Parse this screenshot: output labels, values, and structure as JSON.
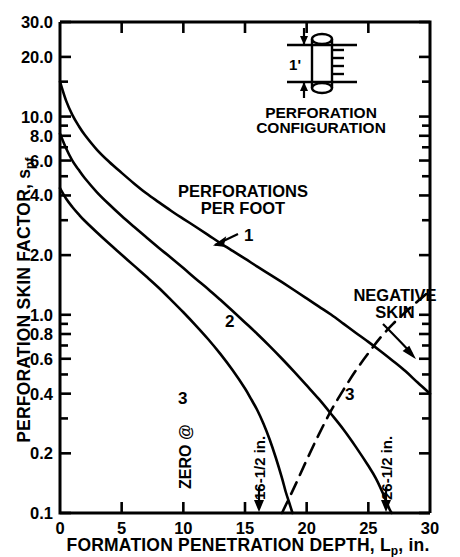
{
  "figure": {
    "background": "#ffffff",
    "ink": "#000000"
  },
  "axes": {
    "y_label": "PERFORATION SKIN FACTOR, s",
    "y_label_sub": "pf",
    "x_label_a": "FORMATION PENETRATION DEPTH, L",
    "x_label_sub": "p",
    "x_label_b": ", in."
  },
  "y_ticks": [
    {
      "label": "30.0",
      "value": 30.0
    },
    {
      "label": "20.0",
      "value": 20.0
    },
    {
      "label": "10.0",
      "value": 10.0
    },
    {
      "label": "8.0",
      "value": 8.0
    },
    {
      "label": "6.0",
      "value": 6.0
    },
    {
      "label": "4.0",
      "value": 4.0
    },
    {
      "label": "2.0",
      "value": 2.0
    },
    {
      "label": "1.0",
      "value": 1.0
    },
    {
      "label": "0.8",
      "value": 0.8
    },
    {
      "label": "0.6",
      "value": 0.6
    },
    {
      "label": "0.4",
      "value": 0.4
    },
    {
      "label": "0.2",
      "value": 0.2
    },
    {
      "label": "0.1",
      "value": 0.1
    }
  ],
  "x_ticks": [
    {
      "label": "0",
      "value": 0
    },
    {
      "label": "5",
      "value": 5
    },
    {
      "label": "10",
      "value": 10
    },
    {
      "label": "15",
      "value": 15
    },
    {
      "label": "20",
      "value": 20
    },
    {
      "label": "25",
      "value": 25
    },
    {
      "label": "30",
      "value": 30
    }
  ],
  "annotations": {
    "perf_per_foot_line1": "PERFORATIONS",
    "perf_per_foot_line2": "PER FOOT",
    "curve_label_1": "1",
    "curve_label_2": "2",
    "curve_label_3": "3",
    "curve_label_3_dashed": "3",
    "negative_skin_line1": "NEGATIVE",
    "negative_skin_line2": "SKIN",
    "zero_at": "ZERO @",
    "callout_16": "16-1/2 in.",
    "callout_26": "26-1/2 in."
  },
  "inset": {
    "title_line1": "PERFORATION",
    "title_line2": "CONFIGURATION",
    "spacing_label": "1'"
  },
  "chart_data": {
    "type": "line",
    "title": "",
    "xlabel": "FORMATION PENETRATION DEPTH, Lp, in.",
    "ylabel": "PERFORATION SKIN FACTOR, spf",
    "xlim": [
      0,
      30
    ],
    "ylim": [
      0.1,
      30.0
    ],
    "yscale": "log",
    "xscale": "linear",
    "grid": false,
    "legend": "none",
    "series": [
      {
        "name": "1",
        "style": "solid",
        "label": "1 perforation per foot",
        "points": [
          [
            0.0,
            15.0
          ],
          [
            0.5,
            12.0
          ],
          [
            1.0,
            10.2
          ],
          [
            1.5,
            9.0
          ],
          [
            2.0,
            8.1
          ],
          [
            3.0,
            6.8
          ],
          [
            4.0,
            5.9
          ],
          [
            5.0,
            5.2
          ],
          [
            6.0,
            4.6
          ],
          [
            7.0,
            4.1
          ],
          [
            8.0,
            3.7
          ],
          [
            9.0,
            3.35
          ],
          [
            10.0,
            3.05
          ],
          [
            11.0,
            2.78
          ],
          [
            12.0,
            2.53
          ],
          [
            13.0,
            2.3
          ],
          [
            14.0,
            2.1
          ],
          [
            15.0,
            1.92
          ],
          [
            16.0,
            1.75
          ],
          [
            17.0,
            1.6
          ],
          [
            18.0,
            1.46
          ],
          [
            19.0,
            1.33
          ],
          [
            20.0,
            1.21
          ],
          [
            21.0,
            1.1
          ],
          [
            22.0,
            1.0
          ],
          [
            23.0,
            0.9
          ],
          [
            24.0,
            0.81
          ],
          [
            25.0,
            0.73
          ],
          [
            26.0,
            0.655
          ],
          [
            27.0,
            0.585
          ],
          [
            28.0,
            0.52
          ],
          [
            29.0,
            0.455
          ],
          [
            30.0,
            0.4
          ]
        ]
      },
      {
        "name": "2",
        "style": "solid",
        "label": "2 perforations per foot",
        "points": [
          [
            0.0,
            8.2
          ],
          [
            0.5,
            6.9
          ],
          [
            1.0,
            6.0
          ],
          [
            1.5,
            5.4
          ],
          [
            2.0,
            4.9
          ],
          [
            3.0,
            4.15
          ],
          [
            4.0,
            3.6
          ],
          [
            5.0,
            3.15
          ],
          [
            6.0,
            2.78
          ],
          [
            7.0,
            2.46
          ],
          [
            8.0,
            2.18
          ],
          [
            9.0,
            1.94
          ],
          [
            10.0,
            1.72
          ],
          [
            11.0,
            1.52
          ],
          [
            12.0,
            1.35
          ],
          [
            13.0,
            1.19
          ],
          [
            14.0,
            1.045
          ],
          [
            15.0,
            0.915
          ],
          [
            16.0,
            0.8
          ],
          [
            17.0,
            0.695
          ],
          [
            18.0,
            0.6
          ],
          [
            19.0,
            0.515
          ],
          [
            20.0,
            0.44
          ],
          [
            21.0,
            0.375
          ],
          [
            22.0,
            0.315
          ],
          [
            23.0,
            0.263
          ],
          [
            24.0,
            0.215
          ],
          [
            25.0,
            0.173
          ],
          [
            25.6,
            0.15
          ],
          [
            26.2,
            0.125
          ],
          [
            26.7,
            0.105
          ],
          [
            26.9,
            0.1
          ]
        ]
      },
      {
        "name": "3",
        "style": "solid",
        "label": "3 perforations per foot",
        "points": [
          [
            0.0,
            4.35
          ],
          [
            0.5,
            3.85
          ],
          [
            1.0,
            3.5
          ],
          [
            1.5,
            3.22
          ],
          [
            2.0,
            2.98
          ],
          [
            3.0,
            2.6
          ],
          [
            4.0,
            2.28
          ],
          [
            5.0,
            2.01
          ],
          [
            6.0,
            1.77
          ],
          [
            7.0,
            1.56
          ],
          [
            8.0,
            1.37
          ],
          [
            9.0,
            1.19
          ],
          [
            10.0,
            1.03
          ],
          [
            11.0,
            0.885
          ],
          [
            12.0,
            0.755
          ],
          [
            13.0,
            0.635
          ],
          [
            14.0,
            0.525
          ],
          [
            15.0,
            0.425
          ],
          [
            15.5,
            0.375
          ],
          [
            16.0,
            0.33
          ],
          [
            16.5,
            0.282
          ],
          [
            17.0,
            0.235
          ],
          [
            17.5,
            0.19
          ],
          [
            18.0,
            0.15
          ],
          [
            18.3,
            0.128
          ],
          [
            18.6,
            0.112
          ],
          [
            18.85,
            0.1
          ]
        ]
      },
      {
        "name": "3-negative",
        "style": "dashed",
        "label": "3 perforations per foot, negative skin branch",
        "points": [
          [
            18.0,
            0.1
          ],
          [
            19.0,
            0.135
          ],
          [
            20.0,
            0.185
          ],
          [
            21.0,
            0.25
          ],
          [
            22.0,
            0.33
          ],
          [
            23.0,
            0.42
          ],
          [
            24.0,
            0.525
          ],
          [
            25.0,
            0.64
          ],
          [
            26.0,
            0.77
          ],
          [
            27.0,
            0.9
          ],
          [
            28.0,
            1.03
          ],
          [
            29.0,
            1.17
          ],
          [
            30.0,
            1.32
          ]
        ]
      }
    ],
    "callouts": [
      {
        "text": "16-1/2 in.",
        "x": 16.5,
        "note": "zero skin for 3 spf curve"
      },
      {
        "text": "26-1/2 in.",
        "x": 26.5,
        "note": "zero skin for 2 spf curve"
      }
    ]
  }
}
